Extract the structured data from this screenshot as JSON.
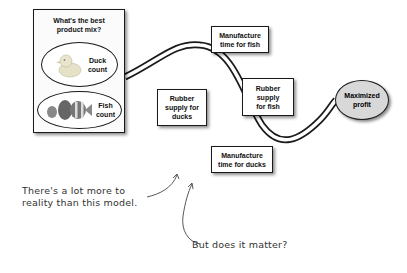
{
  "product_mix": {
    "title_line1": "What's the best",
    "title_line2": "product mix?",
    "duck": {
      "line1": "Duck",
      "line2": "count",
      "icon": "rubber-duck-icon"
    },
    "fish": {
      "line1": "Fish",
      "line2": "count",
      "icon": "fish-icon"
    }
  },
  "constraints": [
    {
      "id": "manufacture-time-fish",
      "line1": "Manufacture",
      "line2": "time for fish",
      "line3": ""
    },
    {
      "id": "rubber-supply-ducks",
      "line1": "Rubber",
      "line2": "supply for",
      "line3": "ducks"
    },
    {
      "id": "rubber-supply-fish",
      "line1": "Rubber",
      "line2": "supply",
      "line3": "for fish"
    },
    {
      "id": "manufacture-time-ducks",
      "line1": "Manufacture",
      "line2": "time for ducks",
      "line3": ""
    }
  ],
  "goal": {
    "line1": "Maximized",
    "line2": "profit"
  },
  "annotations": {
    "note1_line1": "There's a lot more to",
    "note1_line2": "reality than this model.",
    "note2": "But does it matter?"
  },
  "colors": {
    "outline": "#1a1a1a",
    "goal_fill": "#d8d8d8",
    "pipe_fill": "#ffffff",
    "handwriting": "#333333"
  }
}
